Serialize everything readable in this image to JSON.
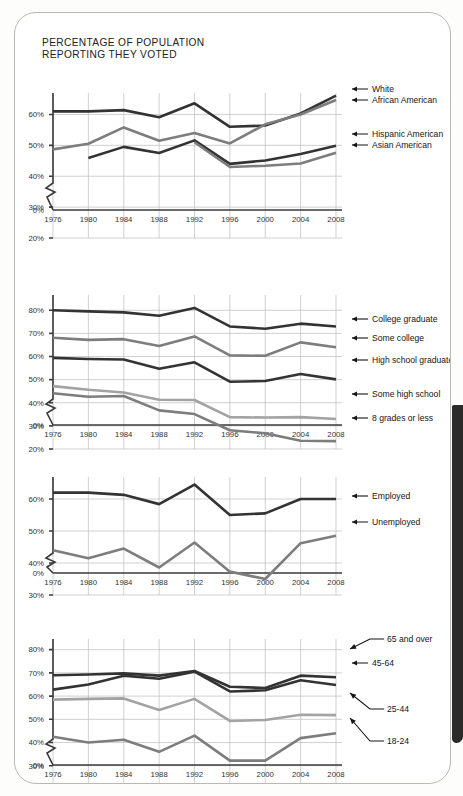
{
  "title": {
    "line1": "PERCENTAGE OF POPULATION",
    "line2": "REPORTING THEY VOTED"
  },
  "colors": {
    "dark": "#333333",
    "mid": "#7d7d7d",
    "light": "#a3a3a3",
    "gridline": "#bcbcbc",
    "axis": "#3a3a3a",
    "spine": "#2b2b2b"
  },
  "chart_data": [
    {
      "type": "line",
      "id": "race-ethnicity",
      "title": "PERCENTAGE OF POPULATION REPORTING THEY VOTED",
      "xlabel": "",
      "ylabel": "",
      "grid": true,
      "legend_position": "right",
      "axis_break": true,
      "x": [
        1976,
        1980,
        1984,
        1988,
        1992,
        1996,
        2000,
        2004,
        2008
      ],
      "categories": [
        "1976",
        "1980",
        "1984",
        "1988",
        "1992",
        "1996",
        "2000",
        "2004",
        "2008"
      ],
      "yticks": [
        0,
        20,
        30,
        40,
        50,
        60
      ],
      "yticklabels": [
        "0%",
        "20%",
        "30%",
        "40%",
        "50%",
        "60%"
      ],
      "ylim": [
        20,
        65
      ],
      "series": [
        {
          "name": "White",
          "color": "dark",
          "values": [
            61.0,
            61.0,
            61.4,
            59.1,
            63.6,
            56.0,
            56.4,
            60.3,
            66.1
          ]
        },
        {
          "name": "African American",
          "color": "mid",
          "values": [
            48.7,
            50.5,
            55.8,
            51.5,
            54.0,
            50.6,
            56.8,
            60.0,
            64.7
          ]
        },
        {
          "name": "Hispanic American",
          "color": "dark",
          "values": [
            null,
            45.9,
            49.5,
            47.5,
            51.6,
            44.0,
            45.1,
            47.2,
            49.9
          ]
        },
        {
          "name": "Asian American",
          "color": "mid",
          "values": [
            null,
            null,
            null,
            null,
            51.0,
            43.0,
            43.4,
            44.1,
            47.6
          ]
        }
      ]
    },
    {
      "type": "line",
      "id": "education",
      "title": "",
      "xlabel": "",
      "ylabel": "",
      "grid": true,
      "legend_position": "right",
      "axis_break": true,
      "x": [
        1976,
        1980,
        1984,
        1988,
        1992,
        1996,
        2000,
        2004,
        2008
      ],
      "categories": [
        "1976",
        "1980",
        "1984",
        "1988",
        "1992",
        "1996",
        "2000",
        "2004",
        "2008"
      ],
      "yticks": [
        0,
        20,
        30,
        40,
        50,
        60,
        70,
        80
      ],
      "yticklabels": [
        "0%",
        "20%",
        "30%",
        "40%",
        "50%",
        "60%",
        "70%",
        "80%"
      ],
      "ylim": [
        20,
        84
      ],
      "series": [
        {
          "name": "College graduate",
          "color": "dark",
          "values": [
            80.0,
            79.5,
            79.1,
            77.6,
            81.0,
            73.0,
            72.0,
            74.2,
            73.0
          ]
        },
        {
          "name": "Some college",
          "color": "mid",
          "values": [
            68.1,
            67.2,
            67.5,
            64.5,
            68.7,
            60.5,
            60.3,
            66.1,
            64.0
          ]
        },
        {
          "name": "High school graduate",
          "color": "dark",
          "values": [
            59.4,
            58.9,
            58.7,
            54.7,
            57.5,
            49.1,
            49.4,
            52.4,
            50.1
          ]
        },
        {
          "name": "Some high school",
          "color": "light",
          "values": [
            47.2,
            45.6,
            44.4,
            41.3,
            41.2,
            33.8,
            33.6,
            33.8,
            33.0
          ]
        },
        {
          "name": "8 grades or less",
          "color": "mid",
          "values": [
            44.1,
            42.6,
            42.9,
            36.7,
            35.1,
            28.1,
            26.8,
            23.6,
            23.4
          ]
        }
      ]
    },
    {
      "type": "line",
      "id": "employment-status",
      "title": "",
      "xlabel": "",
      "ylabel": "",
      "grid": true,
      "legend_position": "right",
      "axis_break": true,
      "x": [
        1976,
        1980,
        1984,
        1988,
        1992,
        1996,
        2000,
        2004,
        2008
      ],
      "categories": [
        "1976",
        "1980",
        "1984",
        "1988",
        "1992",
        "1996",
        "2000",
        "2004",
        "2008"
      ],
      "yticks": [
        0,
        30,
        40,
        50,
        60
      ],
      "yticklabels": [
        "0%",
        "30%",
        "40%",
        "50%",
        "60%"
      ],
      "ylim": [
        30,
        65
      ],
      "series": [
        {
          "name": "Employed",
          "color": "dark",
          "values": [
            62.0,
            62.0,
            61.3,
            58.4,
            64.5,
            55.0,
            55.5,
            60.0,
            60.0
          ]
        },
        {
          "name": "Unemployed",
          "color": "mid",
          "values": [
            44.0,
            41.5,
            44.5,
            38.6,
            46.4,
            37.3,
            35.0,
            46.2,
            48.5
          ]
        }
      ]
    },
    {
      "type": "line",
      "id": "age-group",
      "title": "",
      "xlabel": "",
      "ylabel": "",
      "grid": true,
      "legend_position": "right",
      "axis_break": true,
      "x": [
        1976,
        1980,
        1984,
        1988,
        1992,
        1996,
        2000,
        2004,
        2008
      ],
      "categories": [
        "1976",
        "1980",
        "1984",
        "1988",
        "1992",
        "1996",
        "2000",
        "2004",
        "2008"
      ],
      "yticks": [
        0,
        20,
        30,
        40,
        50,
        60,
        70,
        80
      ],
      "yticklabels": [
        "0%",
        "20%",
        "30%",
        "40%",
        "50%",
        "60%",
        "70%",
        "80%"
      ],
      "ylim": [
        20,
        82
      ],
      "series": [
        {
          "name": "65 and over",
          "color": "dark",
          "values": [
            69.0,
            69.3,
            69.8,
            68.8,
            70.8,
            64.0,
            63.5,
            68.8,
            68.1
          ]
        },
        {
          "name": "45-64",
          "color": "dark",
          "values": [
            62.8,
            65.0,
            68.8,
            67.5,
            70.5,
            62.0,
            62.5,
            66.8,
            64.8
          ]
        },
        {
          "name": "25-44",
          "color": "light",
          "values": [
            58.5,
            58.8,
            59.0,
            54.0,
            58.8,
            49.3,
            49.7,
            52.0,
            51.8
          ]
        },
        {
          "name": "18-24",
          "color": "mid",
          "values": [
            42.5,
            40.0,
            41.2,
            36.0,
            43.0,
            32.2,
            32.2,
            41.9,
            44.0
          ]
        }
      ]
    }
  ]
}
